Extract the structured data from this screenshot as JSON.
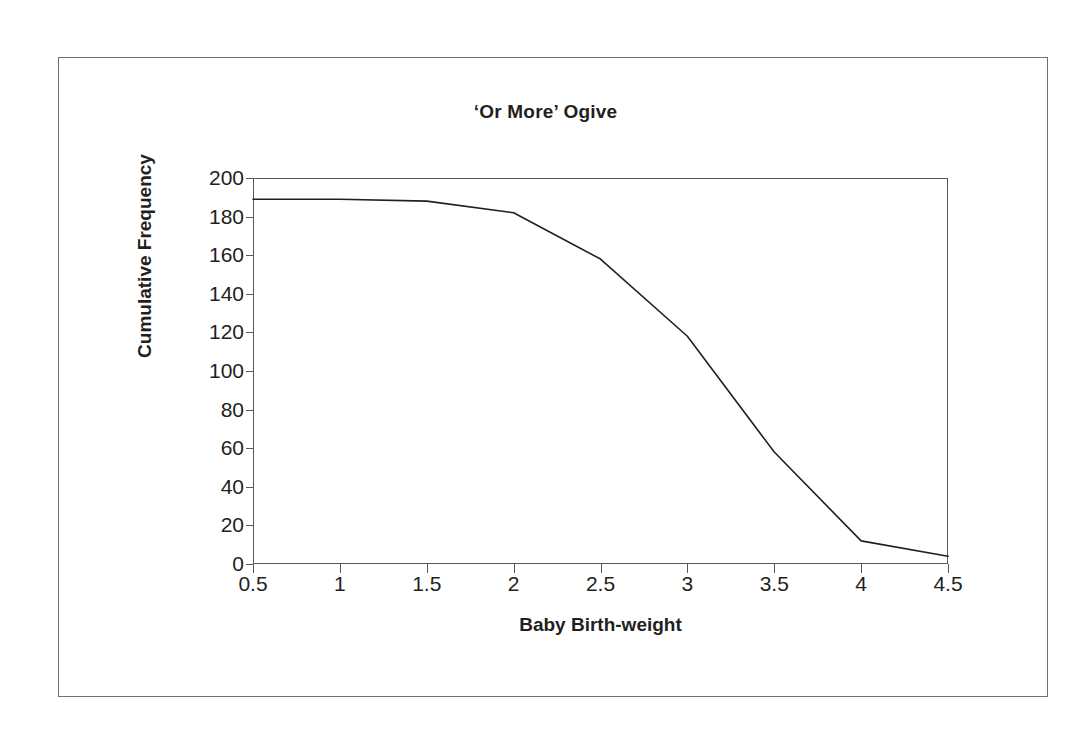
{
  "chart_data": {
    "type": "line",
    "title": "‘Or More’ Ogive",
    "xlabel": "Baby Birth-weight",
    "ylabel": "Cumulative Frequency",
    "xlim": [
      0.5,
      4.5
    ],
    "ylim": [
      0,
      200
    ],
    "xticks": [
      "0.5",
      "1",
      "1.5",
      "2",
      "2.5",
      "3",
      "3.5",
      "4",
      "4.5"
    ],
    "xtick_values": [
      0.5,
      1,
      1.5,
      2,
      2.5,
      3,
      3.5,
      4,
      4.5
    ],
    "yticks": [
      "0",
      "20",
      "40",
      "60",
      "80",
      "100",
      "120",
      "140",
      "160",
      "180",
      "200"
    ],
    "ytick_values": [
      0,
      20,
      40,
      60,
      80,
      100,
      120,
      140,
      160,
      180,
      200
    ],
    "grid": false,
    "legend": null,
    "series": [
      {
        "name": "'Or More' cumulative frequency",
        "x": [
          0.5,
          1.0,
          1.5,
          2.0,
          2.5,
          3.0,
          3.5,
          4.0,
          4.5
        ],
        "values": [
          189,
          189,
          188,
          182,
          158,
          118,
          58,
          12,
          4
        ]
      }
    ],
    "line_color": "#231f20",
    "line_width": 1.6
  },
  "figure": {
    "border_color": "#6f6f70",
    "background": "#ffffff",
    "axis_color": "#58595b"
  }
}
